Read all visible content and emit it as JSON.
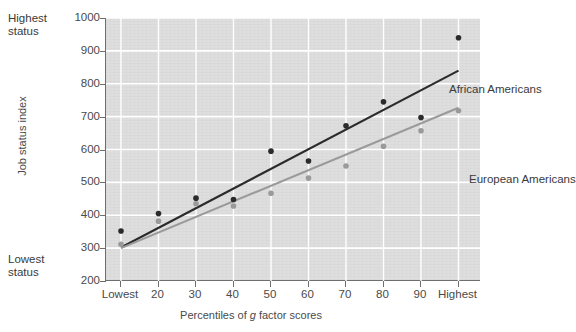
{
  "chart_data": {
    "type": "scatter",
    "title": "",
    "xlabel": "Percentiles of g factor scores",
    "ylabel": "Job status index",
    "categories": [
      "Lowest",
      "20",
      "30",
      "40",
      "50",
      "60",
      "70",
      "80",
      "90",
      "Highest"
    ],
    "xticks": [
      "Lowest",
      "20",
      "30",
      "40",
      "50",
      "60",
      "70",
      "80",
      "90",
      "Highest"
    ],
    "yticks": [
      "200",
      "300",
      "400",
      "500",
      "600",
      "700",
      "800",
      "900",
      "1000"
    ],
    "ylim": [
      200,
      1000
    ],
    "grid": true,
    "legend_position": "in-plot-annotations",
    "series": [
      {
        "name": "African Americans",
        "color": "#2b2b2b",
        "values": [
          352,
          405,
          452,
          448,
          595,
          565,
          672,
          745,
          697,
          940
        ],
        "trendline": {
          "x_start": "Lowest",
          "y_start": 302,
          "x_end": "Highest",
          "y_end": 840
        }
      },
      {
        "name": "European Americans",
        "color": "#9a9a9a",
        "values": [
          312,
          382,
          435,
          428,
          467,
          513,
          550,
          610,
          657,
          718
        ],
        "trendline": {
          "x_start": "Lowest",
          "y_start": 300,
          "x_end": "Highest",
          "y_end": 727
        }
      }
    ],
    "annotations": [
      {
        "text": "Highest status",
        "position": "top-left-outside-axis"
      },
      {
        "text": "Lowest status",
        "position": "bottom-left-outside-axis"
      }
    ]
  },
  "axes": {
    "y_title": "Job status index",
    "x_title_prefix": "Percentiles of ",
    "x_title_italic": "g",
    "x_title_suffix": " factor scores",
    "top_note": "Highest\nstatus",
    "bottom_note": "Lowest\nstatus"
  },
  "labels": {
    "african_americans": "African Americans",
    "european_americans": "European Americans"
  },
  "colors": {
    "panel_background": "#dedede",
    "gridline": "#ffffff",
    "axis": "#6e6e6e",
    "series_dark": "#2b2b2b",
    "series_light": "#9a9a9a",
    "text": "#3a3a3a"
  }
}
